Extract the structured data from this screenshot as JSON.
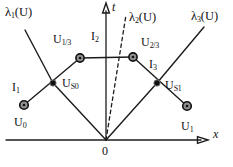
{
  "figure_type": "x-t plane characteristics diagram (Riemann problem wave interactions)",
  "colors": {
    "background": "#ffffff",
    "line": "#1c1c1c",
    "node_fill": "#8f8f8f",
    "node_stroke": "#111111",
    "node_center": "#111111",
    "interaction_dot": "#111111"
  },
  "labels": {
    "lambda1": {
      "pre": "λ",
      "sub": "1",
      "post": "(U)"
    },
    "lambda2": {
      "pre": "λ",
      "sub": "2",
      "post": "(U)"
    },
    "lambda3": {
      "pre": "λ",
      "sub": "3",
      "post": "(U)"
    },
    "t_axis": {
      "pre": "t"
    },
    "x_axis": {
      "pre": "x"
    },
    "origin": {
      "pre": "0"
    },
    "U0": {
      "pre": "U",
      "sub": "0"
    },
    "U13": {
      "pre": "U",
      "sub": "1/3"
    },
    "U23": {
      "pre": "U",
      "sub": "2/3"
    },
    "U1": {
      "pre": "U",
      "sub": "1"
    },
    "US0": {
      "pre": "U",
      "sub": "S0"
    },
    "US1": {
      "pre": "U",
      "sub": "S1"
    },
    "I1": {
      "pre": "I",
      "sub": "1"
    },
    "I2": {
      "pre": "I",
      "sub": "2"
    },
    "I3": {
      "pre": "I",
      "sub": "3"
    }
  }
}
